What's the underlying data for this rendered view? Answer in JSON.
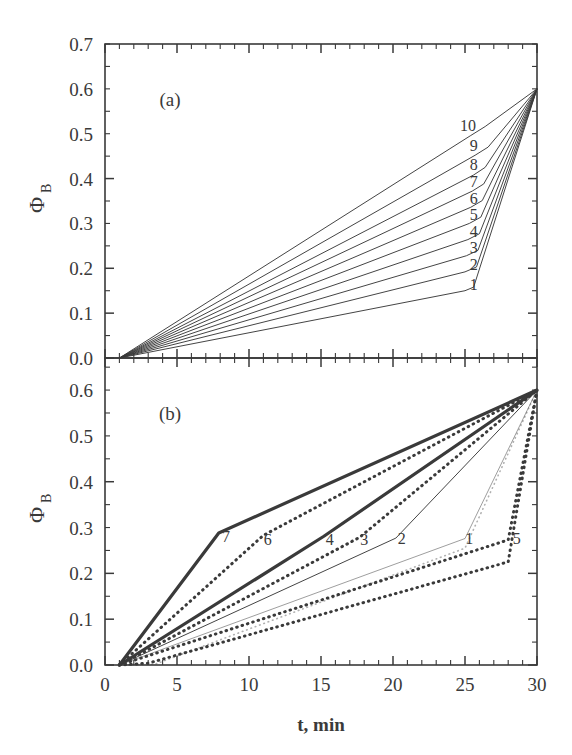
{
  "figure": {
    "xlabel": "t, min",
    "ylabel_main": "Φ",
    "ylabel_sub": "B",
    "panel_a_tag": "(a)",
    "panel_b_tag": "(b)",
    "line_color": "#3a3a3a"
  },
  "chart_data": [
    {
      "type": "line",
      "title": "(a)",
      "xlabel": "t, min",
      "ylabel": "Φ_B",
      "xlim": [
        0,
        30
      ],
      "ylim": [
        0.0,
        0.7
      ],
      "xticks": [
        0,
        5,
        10,
        15,
        20,
        25,
        30
      ],
      "xticklabels": [
        "0",
        "5",
        "10",
        "15",
        "20",
        "25",
        "30"
      ],
      "yticks": [
        0.0,
        0.1,
        0.2,
        0.3,
        0.4,
        0.5,
        0.6,
        0.7
      ],
      "yticklabels": [
        "0.0",
        "0.1",
        "0.2",
        "0.3",
        "0.4",
        "0.5",
        "0.6",
        "0.7"
      ],
      "grid": false,
      "legend": "inline-curve-labels",
      "series": [
        {
          "name": "1",
          "style": "thin-solid",
          "label_xy": [
            25.6,
            0.152
          ],
          "points": [
            [
              1,
              0.0
            ],
            [
              25.0,
              0.15
            ],
            [
              25.6,
              0.158
            ],
            [
              30,
              0.6
            ]
          ]
        },
        {
          "name": "2",
          "style": "thin-solid",
          "label_xy": [
            25.6,
            0.196
          ],
          "points": [
            [
              1,
              0.0
            ],
            [
              25.0,
              0.192
            ],
            [
              25.8,
              0.203
            ],
            [
              30,
              0.6
            ]
          ]
        },
        {
          "name": "3",
          "style": "thin-solid",
          "label_xy": [
            25.6,
            0.233
          ],
          "points": [
            [
              1,
              0.0
            ],
            [
              25.1,
              0.228
            ],
            [
              25.9,
              0.24
            ],
            [
              30,
              0.6
            ]
          ]
        },
        {
          "name": "4",
          "style": "thin-solid",
          "label_xy": [
            25.6,
            0.27
          ],
          "points": [
            [
              1,
              0.0
            ],
            [
              25.2,
              0.264
            ],
            [
              26.0,
              0.277
            ],
            [
              30,
              0.6
            ]
          ]
        },
        {
          "name": "5",
          "style": "thin-solid",
          "label_xy": [
            25.6,
            0.307
          ],
          "points": [
            [
              1,
              0.0
            ],
            [
              25.3,
              0.3
            ],
            [
              26.1,
              0.314
            ],
            [
              30,
              0.6
            ]
          ]
        },
        {
          "name": "6",
          "style": "thin-solid",
          "label_xy": [
            25.6,
            0.344
          ],
          "points": [
            [
              1,
              0.0
            ],
            [
              25.4,
              0.336
            ],
            [
              26.2,
              0.351
            ],
            [
              30,
              0.6
            ]
          ]
        },
        {
          "name": "7",
          "style": "thin-solid",
          "label_xy": [
            25.6,
            0.381
          ],
          "points": [
            [
              1,
              0.0
            ],
            [
              25.5,
              0.372
            ],
            [
              26.3,
              0.388
            ],
            [
              30,
              0.6
            ]
          ]
        },
        {
          "name": "8",
          "style": "thin-solid",
          "label_xy": [
            25.6,
            0.418
          ],
          "points": [
            [
              1,
              0.0
            ],
            [
              25.6,
              0.408
            ],
            [
              26.4,
              0.425
            ],
            [
              30,
              0.6
            ]
          ]
        },
        {
          "name": "9",
          "style": "thin-solid",
          "label_xy": [
            25.6,
            0.462
          ],
          "points": [
            [
              1,
              0.0
            ],
            [
              25.7,
              0.452
            ],
            [
              26.6,
              0.47
            ],
            [
              30,
              0.6
            ]
          ]
        },
        {
          "name": "10",
          "style": "thin-solid",
          "label_xy": [
            25.2,
            0.506
          ],
          "points": [
            [
              1,
              0.0
            ],
            [
              25.4,
              0.496
            ],
            [
              26.4,
              0.516
            ],
            [
              30,
              0.6
            ]
          ]
        }
      ]
    },
    {
      "type": "line",
      "title": "(b)",
      "xlabel": "t, min",
      "ylabel": "Φ_B",
      "xlim": [
        0,
        30
      ],
      "ylim": [
        0.0,
        0.67
      ],
      "xticks": [
        0,
        5,
        10,
        15,
        20,
        25,
        30
      ],
      "xticklabels": [
        "0",
        "5",
        "10",
        "15",
        "20",
        "25",
        "30"
      ],
      "yticks": [
        0.0,
        0.1,
        0.2,
        0.3,
        0.4,
        0.5,
        0.6
      ],
      "yticklabels": [
        "0.0",
        "0.1",
        "0.2",
        "0.3",
        "0.4",
        "0.5",
        "0.6"
      ],
      "grid": false,
      "legend": "inline-curve-labels",
      "series": [
        {
          "name": "7",
          "style": "thick-solid",
          "label_xy": [
            8.4,
            0.268
          ],
          "points": [
            [
              1,
              0.0
            ],
            [
              7.9,
              0.288
            ],
            [
              30,
              0.6
            ]
          ]
        },
        {
          "name": "6",
          "style": "bold-dotted",
          "label_xy": [
            11.3,
            0.262
          ],
          "points": [
            [
              1,
              0.0
            ],
            [
              11.0,
              0.283
            ],
            [
              30,
              0.6
            ]
          ]
        },
        {
          "name": "4",
          "style": "thick-solid",
          "label_xy": [
            15.6,
            0.262
          ],
          "points": [
            [
              1,
              0.0
            ],
            [
              15.2,
              0.281
            ],
            [
              30,
              0.6
            ]
          ]
        },
        {
          "name": "3",
          "style": "bold-dotted",
          "label_xy": [
            18.0,
            0.262
          ],
          "points": [
            [
              1,
              0.0
            ],
            [
              17.7,
              0.279
            ],
            [
              30,
              0.6
            ]
          ]
        },
        {
          "name": "2",
          "style": "thin-solid",
          "label_xy": [
            20.6,
            0.264
          ],
          "points": [
            [
              1,
              0.0
            ],
            [
              20.2,
              0.277
            ],
            [
              30,
              0.6
            ]
          ]
        },
        {
          "name": "1",
          "style": "thin-light",
          "label_xy": [
            25.3,
            0.264
          ],
          "points": [
            [
              1,
              0.0
            ],
            [
              25.0,
              0.276
            ],
            [
              30,
              0.6
            ]
          ]
        },
        {
          "name": "5",
          "style": "bold-dotted",
          "label_xy": [
            28.6,
            0.264
          ],
          "points": [
            [
              1,
              0.0
            ],
            [
              28.0,
              0.273
            ],
            [
              30,
              0.6
            ]
          ]
        }
      ]
    }
  ]
}
